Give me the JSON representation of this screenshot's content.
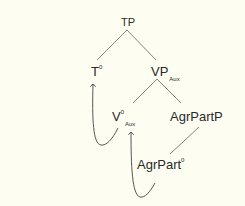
{
  "diagram": {
    "type": "syntax-tree",
    "background": "#fdfdf2",
    "line_color": "#555555",
    "nodes": {
      "tp": {
        "label": "TP"
      },
      "t0": {
        "label": "T",
        "superscript": "0"
      },
      "vp_aux": {
        "label": "VP",
        "subscript": "Aux"
      },
      "v0_aux": {
        "label": "V",
        "superscript": "0",
        "subscript": "Aux"
      },
      "agrpartp": {
        "label": "AgrPartP"
      },
      "agrpart0": {
        "label": "AgrPart",
        "superscript": "0"
      }
    },
    "edges": [
      {
        "from": "TP",
        "to": "T0"
      },
      {
        "from": "TP",
        "to": "VP_Aux"
      },
      {
        "from": "VP_Aux",
        "to": "V0_Aux"
      },
      {
        "from": "VP_Aux",
        "to": "AgrPartP"
      },
      {
        "from": "AgrPartP",
        "to": "AgrPart0"
      }
    ],
    "movement_arrows": [
      {
        "from": "V0_Aux",
        "to": "T0"
      },
      {
        "from": "AgrPart0",
        "to": "V0_Aux"
      }
    ]
  }
}
